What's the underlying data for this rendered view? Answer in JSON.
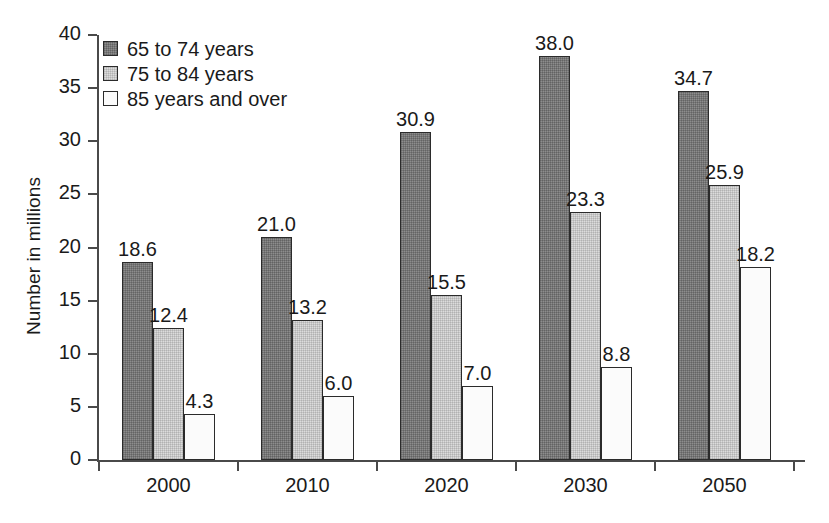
{
  "chart_data": {
    "type": "bar",
    "title": "",
    "subtitle": "",
    "xlabel": "",
    "ylabel": "Number in millions",
    "categories": [
      "2000",
      "2010",
      "2020",
      "2030",
      "2050"
    ],
    "series": [
      {
        "name": "65 to 74 years",
        "swatch": "dark-gray",
        "color": "#8d8d8d",
        "values": [
          18.6,
          21.0,
          30.9,
          38.0,
          34.7
        ],
        "labels": [
          "18.6",
          "21.0",
          "30.9",
          "38.0",
          "34.7"
        ]
      },
      {
        "name": "75 to 84 years",
        "swatch": "light-gray",
        "color": "#dcdcdc",
        "values": [
          12.4,
          13.2,
          15.5,
          23.3,
          25.9
        ],
        "labels": [
          "12.4",
          "13.2",
          "15.5",
          "23.3",
          "25.9"
        ]
      },
      {
        "name": "85 years and over",
        "swatch": "white",
        "color": "#fbfbfb",
        "values": [
          4.3,
          6.0,
          7.0,
          8.8,
          18.2
        ],
        "labels": [
          "4.3",
          "6.0",
          "7.0",
          "8.8",
          "18.2"
        ]
      }
    ],
    "ylim": [
      0,
      40
    ],
    "ytick_values": [
      0,
      5,
      10,
      15,
      20,
      25,
      30,
      35,
      40
    ],
    "ytick_labels": [
      "0",
      "5",
      "10",
      "15",
      "20",
      "25",
      "30",
      "35",
      "40"
    ],
    "grid": false,
    "legend_position": "top-left",
    "show_data_labels": true,
    "axis_color": "#4a4a4a",
    "bar_border_color": "#2b2b2b",
    "text_color": "#1a1a1a",
    "background": "#ffffff"
  },
  "legend": {
    "items": [
      {
        "label": "65 to 74 years",
        "swatch_class": "fill-dark"
      },
      {
        "label": "75 to 84 years",
        "swatch_class": "fill-light"
      },
      {
        "label": "85 years and over",
        "swatch_class": "fill-white"
      }
    ]
  }
}
